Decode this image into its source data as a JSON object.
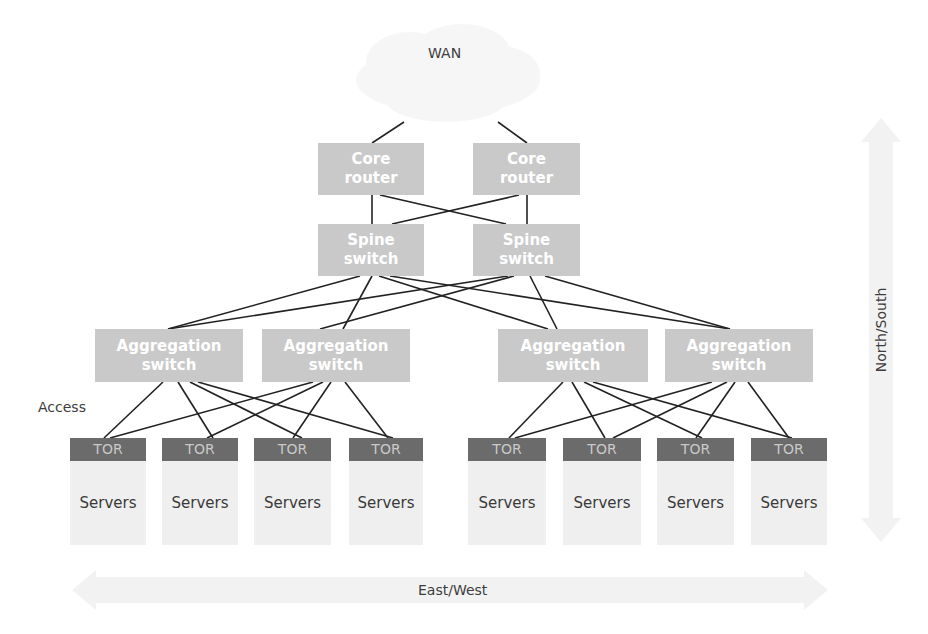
{
  "diagram": {
    "wan": {
      "label": "WAN",
      "icon": "cloud-icon"
    },
    "core_routers": [
      {
        "id": "core1",
        "label": "Core router",
        "x": 318,
        "y": 143,
        "w": 106,
        "h": 52
      },
      {
        "id": "core2",
        "label": "Core router",
        "x": 473,
        "y": 143,
        "w": 107,
        "h": 52
      }
    ],
    "spine_switches": [
      {
        "id": "spine1",
        "label": "Spine switch",
        "x": 318,
        "y": 224,
        "w": 106,
        "h": 52
      },
      {
        "id": "spine2",
        "label": "Spine switch",
        "x": 473,
        "y": 224,
        "w": 107,
        "h": 52
      }
    ],
    "aggregation_switches": [
      {
        "id": "agg1",
        "label": "Aggregation switch",
        "x": 95,
        "y": 329,
        "w": 148,
        "h": 53
      },
      {
        "id": "agg2",
        "label": "Aggregation switch",
        "x": 262,
        "y": 329,
        "w": 148,
        "h": 53
      },
      {
        "id": "agg3",
        "label": "Aggregation switch",
        "x": 498,
        "y": 329,
        "w": 150,
        "h": 53
      },
      {
        "id": "agg4",
        "label": "Aggregation switch",
        "x": 665,
        "y": 329,
        "w": 148,
        "h": 53
      }
    ],
    "racks": [
      {
        "id": "rack1",
        "tor_label": "TOR",
        "servers_label": "Servers",
        "x": 70,
        "w": 76
      },
      {
        "id": "rack2",
        "tor_label": "TOR",
        "servers_label": "Servers",
        "x": 162,
        "w": 76
      },
      {
        "id": "rack3",
        "tor_label": "TOR",
        "servers_label": "Servers",
        "x": 254,
        "w": 77
      },
      {
        "id": "rack4",
        "tor_label": "TOR",
        "servers_label": "Servers",
        "x": 349,
        "w": 74
      },
      {
        "id": "rack5",
        "tor_label": "TOR",
        "servers_label": "Servers",
        "x": 468,
        "w": 78
      },
      {
        "id": "rack6",
        "tor_label": "TOR",
        "servers_label": "Servers",
        "x": 563,
        "w": 78
      },
      {
        "id": "rack7",
        "tor_label": "TOR",
        "servers_label": "Servers",
        "x": 657,
        "w": 77
      },
      {
        "id": "rack8",
        "tor_label": "TOR",
        "servers_label": "Servers",
        "x": 751,
        "w": 76
      }
    ],
    "rack_top": 438,
    "layer_labels": {
      "access": "Access"
    },
    "axes": {
      "east_west": "East/West",
      "north_south": "North/South"
    },
    "links": {
      "wan_core": [
        [
          404,
          122,
          372,
          143
        ],
        [
          498,
          122,
          527,
          143
        ]
      ],
      "core_spine": [
        [
          372,
          195,
          372,
          224
        ],
        [
          527,
          195,
          527,
          224
        ],
        [
          380,
          195,
          506,
          224
        ],
        [
          519,
          195,
          392,
          224
        ]
      ],
      "spine_agg": [
        [
          360,
          276,
          168,
          329
        ],
        [
          372,
          276,
          343,
          329
        ],
        [
          379,
          276,
          548,
          329
        ],
        [
          390,
          276,
          730,
          329
        ],
        [
          508,
          276,
          168,
          329
        ],
        [
          514,
          276,
          320,
          329
        ],
        [
          530,
          276,
          557,
          329
        ],
        [
          545,
          276,
          730,
          329
        ]
      ],
      "agg_tor_left": [
        [
          163,
          382,
          104,
          438
        ],
        [
          178,
          382,
          213,
          438
        ],
        [
          190,
          382,
          302,
          438
        ],
        [
          198,
          382,
          393,
          438
        ],
        [
          313,
          382,
          110,
          438
        ],
        [
          323,
          382,
          207,
          438
        ],
        [
          331,
          382,
          293,
          438
        ],
        [
          345,
          382,
          388,
          438
        ]
      ],
      "agg_tor_right": [
        [
          563,
          382,
          509,
          438
        ],
        [
          572,
          382,
          605,
          438
        ],
        [
          584,
          382,
          702,
          438
        ],
        [
          593,
          382,
          792,
          438
        ],
        [
          712,
          382,
          515,
          438
        ],
        [
          727,
          382,
          613,
          438
        ],
        [
          735,
          382,
          696,
          438
        ],
        [
          748,
          382,
          789,
          438
        ]
      ]
    },
    "colors": {
      "node_fill": "#c9c9c9",
      "node_text": "#ffffff",
      "tor_fill": "#6b6b6b",
      "tor_text": "#c9c9c9",
      "servers_fill": "#efefef",
      "link": "#222222",
      "cloud": "#f6f6f6",
      "arrow": "#f2f2f2"
    }
  }
}
